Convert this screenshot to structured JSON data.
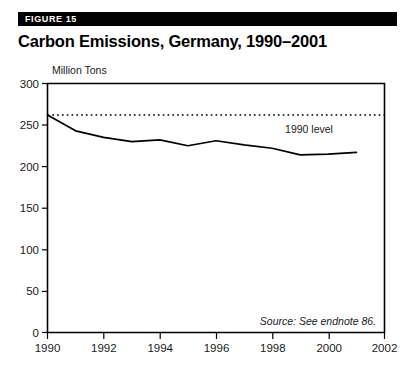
{
  "figure": {
    "banner_label": "FIGURE 15",
    "title": "Carbon Emissions, Germany, 1990–2001",
    "source_note": "Source: See endnote 86."
  },
  "chart_data": {
    "type": "line",
    "title": "Carbon Emissions, Germany, 1990–2001",
    "xlabel": "",
    "ylabel": "Million Tons",
    "ylabel_position": "above-axis",
    "xlim": [
      1990,
      2002
    ],
    "ylim": [
      0,
      300
    ],
    "x_ticks": [
      1990,
      1992,
      1994,
      1996,
      1998,
      2000,
      2002
    ],
    "x_tick_labels": [
      "1990",
      "1992",
      "1994",
      "1996",
      "1998",
      "2000",
      "2002"
    ],
    "y_ticks": [
      0,
      50,
      100,
      150,
      200,
      250,
      300
    ],
    "y_tick_labels": [
      "0",
      "50",
      "100",
      "150",
      "200",
      "250",
      "300"
    ],
    "grid": false,
    "legend": false,
    "line_color": "#000000",
    "x": [
      1990,
      1991,
      1992,
      1993,
      1994,
      1995,
      1996,
      1997,
      1998,
      1999,
      2000,
      2001
    ],
    "series": [
      {
        "name": "Carbon Emissions",
        "style": "solid",
        "values": [
          262,
          243,
          235,
          230,
          232,
          225,
          231,
          226,
          222,
          214,
          215,
          217
        ]
      },
      {
        "name": "1990 level",
        "style": "dotted",
        "constant_value": 262,
        "values": [
          262,
          262,
          262,
          262,
          262,
          262,
          262,
          262,
          262,
          262,
          262,
          262
        ]
      }
    ],
    "annotations": [
      {
        "text": "1990 level",
        "x": 2000,
        "y": 250
      }
    ]
  },
  "axis": {
    "unit_label": "Million Tons"
  },
  "annotation": {
    "level_label": "1990 level"
  }
}
